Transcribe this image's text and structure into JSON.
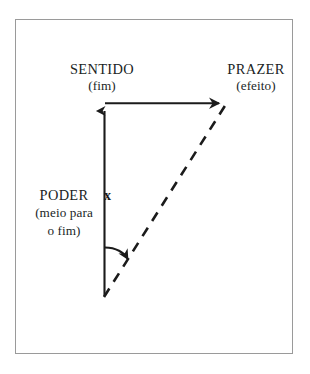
{
  "figure": {
    "type": "concept-diagram",
    "background_color": "#ffffff",
    "frame_border_color": "#9a9a9a",
    "stroke_color": "#1b1b1b"
  },
  "labels": {
    "sentido": {
      "title": "SENTIDO",
      "subtitle": "(fim)"
    },
    "prazer": {
      "title": "PRAZER",
      "subtitle": "(efeito)"
    },
    "poder": {
      "title": "PODER",
      "subtitle_line1": "(meio para",
      "subtitle_line2": "o fim)"
    }
  },
  "marks": {
    "cross_mark": "x"
  },
  "connectors": {
    "vertical_arrow": {
      "name": "poder-to-sentido-arrow",
      "style": "solid",
      "direction": "up"
    },
    "horizontal_arrow": {
      "name": "sentido-to-prazer-arrow",
      "style": "solid",
      "direction": "right"
    },
    "diagonal_line": {
      "name": "poder-to-prazer-dashed-line",
      "style": "dashed",
      "direction": "up-right"
    },
    "curved_arrow": {
      "name": "deviation-curved-arrow",
      "style": "solid-curved",
      "direction": "right"
    }
  }
}
